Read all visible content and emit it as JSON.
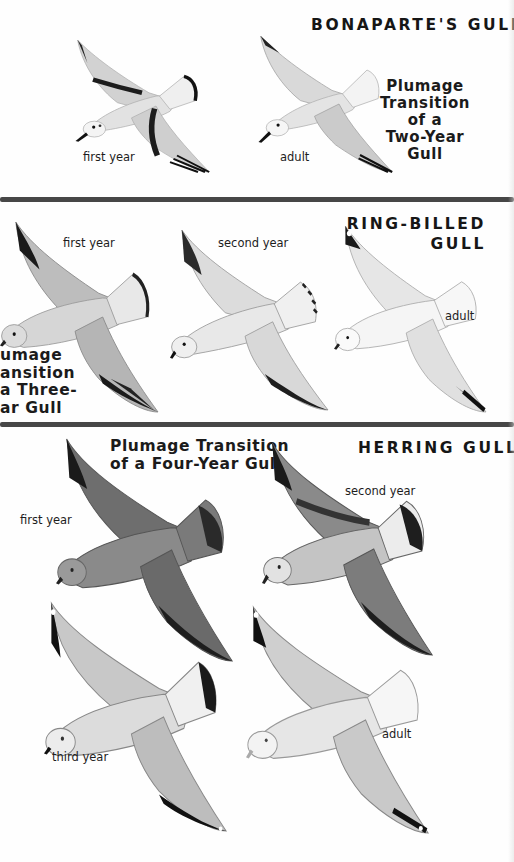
{
  "sections": [
    {
      "species": "BONAPARTE'S GULL",
      "transition_title": [
        "Plumage",
        "Transition of a",
        "Two-Year Gull"
      ],
      "birds": [
        {
          "label": "first year"
        },
        {
          "label": "adult"
        }
      ]
    },
    {
      "species": [
        "RING-BILLED",
        "GULL"
      ],
      "transition_title": [
        "umage",
        "ansition",
        "a Three-",
        "ar Gull"
      ],
      "birds": [
        {
          "label": "first year"
        },
        {
          "label": "second year"
        },
        {
          "label": "adult"
        }
      ]
    },
    {
      "species": "HERRING GULL",
      "transition_title": [
        "Plumage Transition",
        "of a Four-Year Gull"
      ],
      "birds": [
        {
          "label": "first year"
        },
        {
          "label": "second year"
        },
        {
          "label": "third year"
        },
        {
          "label": "adult"
        }
      ]
    }
  ],
  "colors": {
    "background": "#fefefe",
    "separator": "#474747",
    "text": "#1a1a1a"
  }
}
